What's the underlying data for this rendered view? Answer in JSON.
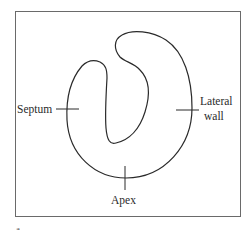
{
  "diagram": {
    "frame": {
      "x": 15,
      "y": 11,
      "width": 226,
      "height": 206,
      "stroke": "#6a6a6a"
    },
    "outline_stroke": "#2a2a2a",
    "labels": {
      "septum": "Septum",
      "lateral_wall_line1": "Lateral",
      "lateral_wall_line2": "wall",
      "apex": "Apex"
    },
    "caption_fragment": "a"
  }
}
